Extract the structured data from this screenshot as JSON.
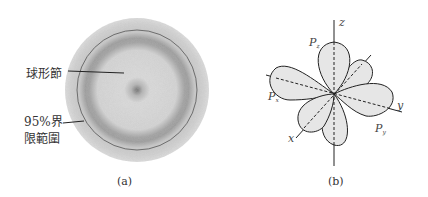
{
  "figure_a": {
    "caption": "(a)",
    "labels": {
      "node": "球形節",
      "boundary_line1": "95%界",
      "boundary_line2": "限範圍"
    },
    "colors": {
      "cloud": "#d4d4d4",
      "ring": "#8a8a8a",
      "boundary": "#555555"
    }
  },
  "figure_b": {
    "caption": "(b)",
    "axes": {
      "x": "x",
      "y": "y",
      "z": "z"
    },
    "orbitals": [
      {
        "name": "P",
        "sub": "z"
      },
      {
        "name": "P",
        "sub": "x"
      },
      {
        "name": "P",
        "sub": "y"
      }
    ],
    "colors": {
      "lobe_fill": "#e6e6e6",
      "stroke": "#222222"
    }
  }
}
